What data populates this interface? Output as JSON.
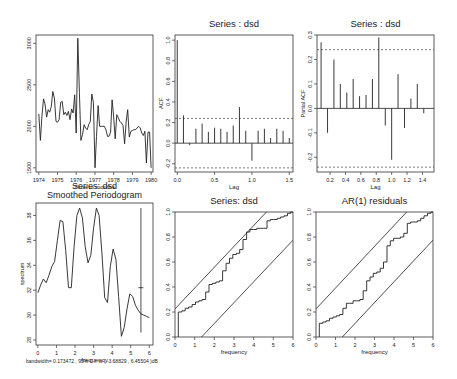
{
  "chart_data": [
    {
      "id": "ts",
      "type": "line",
      "title": "",
      "xlabel": "Time in months",
      "ylabel": "",
      "box": [
        36,
        35,
        153,
        172
      ],
      "xlim": [
        1973.85,
        1980.1
      ],
      "ylim": [
        1450,
        3100
      ],
      "xticks": [
        1974,
        1975,
        1976,
        1977,
        1978,
        1979,
        1980
      ],
      "xtick_labels": [
        "1974",
        "1975",
        "1976",
        "1977",
        "1978",
        "1979",
        "1980"
      ],
      "yticks": [
        1500,
        2000,
        2500,
        3000
      ],
      "ytick_labels": [
        "1500",
        "2000",
        "2500",
        "3000"
      ],
      "x": [
        1974.0,
        1974.083,
        1974.167,
        1974.25,
        1974.333,
        1974.417,
        1974.5,
        1974.583,
        1974.667,
        1974.75,
        1974.833,
        1974.917,
        1975.0,
        1975.083,
        1975.167,
        1975.25,
        1975.333,
        1975.417,
        1975.5,
        1975.583,
        1975.667,
        1975.75,
        1975.833,
        1975.917,
        1976.0,
        1976.083,
        1976.167,
        1976.25,
        1976.333,
        1976.417,
        1976.5,
        1976.583,
        1976.667,
        1976.75,
        1976.833,
        1976.917,
        1977.0,
        1977.083,
        1977.167,
        1977.25,
        1977.333,
        1977.417,
        1977.5,
        1977.583,
        1977.667,
        1977.75,
        1977.833,
        1977.917,
        1978.0,
        1978.083,
        1978.167,
        1978.25,
        1978.333,
        1978.417,
        1978.5,
        1978.583,
        1978.667,
        1978.75,
        1978.833,
        1978.917,
        1979.0,
        1979.083,
        1979.167,
        1979.25,
        1979.333,
        1979.417,
        1979.5,
        1979.583,
        1979.667,
        1979.75,
        1979.833,
        1979.917,
        1980.0
      ],
      "values": [
        2150,
        1830,
        2120,
        2330,
        2270,
        2110,
        2200,
        2170,
        2240,
        2420,
        2340,
        2060,
        2050,
        2080,
        2290,
        2300,
        2140,
        2170,
        2130,
        2180,
        2080,
        2210,
        2160,
        2380,
        1920,
        3060,
        2410,
        1830,
        1900,
        2020,
        1980,
        1960,
        2020,
        2060,
        2390,
        2290,
        1500,
        1880,
        2250,
        2000,
        2000,
        2000,
        2000,
        1960,
        1880,
        1880,
        1930,
        2320,
        2110,
        1850,
        2140,
        2100,
        2060,
        2040,
        2010,
        1790,
        2060,
        2200,
        1870,
        1940,
        1950,
        1960,
        1960,
        1980,
        2000,
        1980,
        1920,
        1890,
        1940,
        1560,
        1930,
        1930,
        1500
      ]
    },
    {
      "id": "acf",
      "type": "bar",
      "title": "Series : dsd",
      "xlabel": "Lag",
      "ylabel": "ACF",
      "box": [
        175,
        35,
        293,
        172
      ],
      "xlim": [
        -0.03,
        1.55
      ],
      "ylim": [
        -0.28,
        1.05
      ],
      "xticks": [
        0.0,
        0.5,
        1.0,
        1.5
      ],
      "xtick_labels": [
        "0.0",
        "0.5",
        "1.0",
        "1.5"
      ],
      "yticks": [
        -0.2,
        0.0,
        0.2,
        0.4,
        0.6,
        0.8,
        1.0
      ],
      "ytick_labels": [
        "-0.2",
        "0.0",
        "0.2",
        "0.4",
        "0.6",
        "0.8",
        "1.0"
      ],
      "x": [
        0.0,
        0.083,
        0.167,
        0.25,
        0.333,
        0.417,
        0.5,
        0.583,
        0.667,
        0.75,
        0.833,
        0.917,
        1.0,
        1.083,
        1.167,
        1.25,
        1.333,
        1.417,
        1.5
      ],
      "values": [
        1.0,
        0.27,
        -0.02,
        0.14,
        0.19,
        0.11,
        0.15,
        0.14,
        0.11,
        0.17,
        0.35,
        0.12,
        -0.17,
        0.12,
        0.14,
        0.05,
        0.14,
        0.12,
        0.05
      ],
      "conf_band": 0.24
    },
    {
      "id": "pacf",
      "type": "bar",
      "title": "Series : dsd",
      "xlabel": "Lag",
      "ylabel": "Partial ACF",
      "box": [
        317,
        35,
        434,
        172
      ],
      "xlim": [
        0.03,
        1.55
      ],
      "ylim": [
        -0.26,
        0.3
      ],
      "xticks": [
        0.2,
        0.4,
        0.6,
        0.8,
        1.0,
        1.2,
        1.4
      ],
      "xtick_labels": [
        "0.2",
        "0.4",
        "0.6",
        "0.8",
        "1.0",
        "1.2",
        "1.4"
      ],
      "yticks": [
        -0.2,
        -0.1,
        0.0,
        0.1,
        0.2,
        0.3
      ],
      "ytick_labels": [
        "-0.2",
        "-0.1",
        "0.0",
        "0.1",
        "0.2",
        "0.3"
      ],
      "x": [
        0.083,
        0.167,
        0.25,
        0.333,
        0.417,
        0.5,
        0.583,
        0.667,
        0.75,
        0.833,
        0.917,
        1.0,
        1.083,
        1.167,
        1.25,
        1.333,
        1.417
      ],
      "values": [
        0.27,
        -0.1,
        0.2,
        0.1,
        0.065,
        0.12,
        0.05,
        0.055,
        0.12,
        0.29,
        -0.07,
        -0.21,
        0.14,
        -0.08,
        0.04,
        0.1,
        -0.02
      ],
      "conf_band": 0.24
    },
    {
      "id": "spec",
      "type": "line",
      "title": "Series: dsd\nSmoothed Periodogram",
      "xlabel": "frequency",
      "ylabel": "spectrum",
      "footnote": "bandwidth= 0.173472 , 95% C.I. is ( -3.68829 , 6.45504 )dB",
      "box": [
        36,
        203,
        153,
        345
      ],
      "xlim": [
        -0.1,
        6.2
      ],
      "ylim": [
        27.6,
        39.0
      ],
      "xticks": [
        0,
        1,
        2,
        3,
        4,
        5,
        6
      ],
      "xtick_labels": [
        "0",
        "1",
        "2",
        "3",
        "4",
        "5",
        "6"
      ],
      "yticks": [
        28,
        30,
        32,
        34,
        36,
        38
      ],
      "ytick_labels": [
        "28",
        "30",
        "32",
        "34",
        "36",
        "38"
      ],
      "x": [
        0.0,
        0.15,
        0.3,
        0.45,
        0.6,
        0.75,
        0.9,
        1.05,
        1.2,
        1.35,
        1.5,
        1.65,
        1.8,
        1.95,
        2.1,
        2.25,
        2.4,
        2.55,
        2.7,
        2.85,
        3.0,
        3.15,
        3.3,
        3.45,
        3.6,
        3.75,
        3.9,
        4.05,
        4.2,
        4.35,
        4.5,
        4.65,
        4.8,
        4.95,
        5.1,
        5.25,
        5.4,
        5.55,
        5.7,
        5.85,
        6.0
      ],
      "values": [
        31.8,
        32.4,
        32.9,
        32.6,
        33.2,
        33.9,
        34.3,
        36.0,
        37.6,
        37.5,
        35.2,
        32.2,
        32.2,
        35.5,
        38.0,
        38.6,
        37.8,
        35.5,
        34.2,
        34.8,
        37.0,
        38.6,
        38.0,
        35.0,
        31.4,
        31.0,
        33.9,
        35.3,
        34.5,
        31.5,
        28.3,
        29.0,
        30.5,
        31.7,
        31.5,
        30.8,
        30.4,
        30.1,
        30.0,
        29.9,
        29.8
      ],
      "ci_bar": {
        "x": 5.55,
        "center": 32.2,
        "low": 28.6,
        "high": 38.6
      }
    },
    {
      "id": "cpgram1",
      "type": "line",
      "title": "Series:  dsd",
      "xlabel": "frequency",
      "ylabel": "",
      "box": [
        175,
        212,
        293,
        337
      ],
      "xlim": [
        0,
        6
      ],
      "ylim": [
        0,
        1
      ],
      "xticks": [
        0,
        1,
        2,
        3,
        4,
        5,
        6
      ],
      "xtick_labels": [
        "0",
        "1",
        "2",
        "3",
        "4",
        "5",
        "6"
      ],
      "yticks": [
        0.0,
        0.2,
        0.4,
        0.6,
        0.8,
        1.0
      ],
      "ytick_labels": [
        "0.0",
        "0.2",
        "0.4",
        "0.6",
        "0.8",
        "1.0"
      ],
      "steps_x": [
        0.17,
        0.17,
        0.35,
        0.52,
        0.69,
        0.87,
        1.04,
        1.21,
        1.38,
        1.56,
        1.73,
        1.9,
        2.08,
        2.25,
        2.42,
        2.6,
        2.77,
        2.94,
        3.12,
        3.29,
        3.46,
        3.64,
        3.81,
        3.98,
        4.16,
        4.33,
        4.5,
        4.68,
        4.85,
        5.02,
        5.2,
        5.37,
        5.54,
        5.72,
        5.89,
        6.0
      ],
      "steps_y": [
        0.0,
        0.2,
        0.21,
        0.23,
        0.24,
        0.26,
        0.28,
        0.29,
        0.3,
        0.36,
        0.42,
        0.43,
        0.44,
        0.45,
        0.53,
        0.59,
        0.63,
        0.66,
        0.67,
        0.7,
        0.78,
        0.84,
        0.86,
        0.86,
        0.87,
        0.87,
        0.87,
        0.93,
        0.94,
        0.94,
        0.95,
        0.96,
        0.97,
        0.99,
        1.0,
        1.0
      ],
      "band_offset": 0.225
    },
    {
      "id": "cpgram2",
      "type": "line",
      "title": "AR(1) residuals",
      "xlabel": "frequency",
      "ylabel": "",
      "box": [
        316,
        212,
        433,
        337
      ],
      "xlim": [
        0,
        6
      ],
      "ylim": [
        0,
        1
      ],
      "xticks": [
        0,
        1,
        2,
        3,
        4,
        5,
        6
      ],
      "xtick_labels": [
        "0",
        "1",
        "2",
        "3",
        "4",
        "5",
        "6"
      ],
      "yticks": [
        0.0,
        0.2,
        0.4,
        0.6,
        0.8,
        1.0
      ],
      "ytick_labels": [
        "0.0",
        "0.2",
        "0.4",
        "0.6",
        "0.8",
        "1.0"
      ],
      "steps_x": [
        0.17,
        0.17,
        0.35,
        0.52,
        0.69,
        0.87,
        1.04,
        1.21,
        1.38,
        1.56,
        1.73,
        1.9,
        2.08,
        2.25,
        2.42,
        2.6,
        2.77,
        2.94,
        3.12,
        3.29,
        3.46,
        3.64,
        3.81,
        3.98,
        4.16,
        4.33,
        4.5,
        4.68,
        4.85,
        5.02,
        5.2,
        5.37,
        5.54,
        5.72,
        5.89,
        6.0
      ],
      "steps_y": [
        0.0,
        0.11,
        0.12,
        0.13,
        0.15,
        0.16,
        0.17,
        0.18,
        0.23,
        0.27,
        0.27,
        0.29,
        0.29,
        0.3,
        0.37,
        0.45,
        0.48,
        0.51,
        0.52,
        0.55,
        0.6,
        0.73,
        0.77,
        0.79,
        0.79,
        0.8,
        0.83,
        0.91,
        0.92,
        0.92,
        0.93,
        0.95,
        0.97,
        0.99,
        1.0,
        1.0
      ],
      "band_offset": 0.225
    }
  ]
}
